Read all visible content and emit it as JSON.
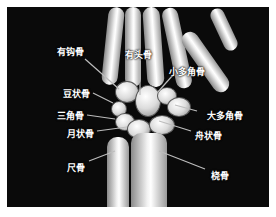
{
  "figure": {
    "background_color": "#0a0a0a",
    "bone_color": "#e8e8e8",
    "label_color": "#ffffff",
    "leader_color": "#bdbdbd"
  },
  "labels": [
    {
      "id": "hamate",
      "text": "有钩骨"
    },
    {
      "id": "capitate",
      "text": "有头骨"
    },
    {
      "id": "trapezoid",
      "text": "小多角骨"
    },
    {
      "id": "pisiform",
      "text": "豆状骨"
    },
    {
      "id": "triquetrum",
      "text": "三角骨"
    },
    {
      "id": "trapezium",
      "text": "大多角骨"
    },
    {
      "id": "lunate",
      "text": "月状骨"
    },
    {
      "id": "scaphoid",
      "text": "舟状骨"
    },
    {
      "id": "ulna",
      "text": "尺骨"
    },
    {
      "id": "radius",
      "text": "桡骨"
    }
  ]
}
